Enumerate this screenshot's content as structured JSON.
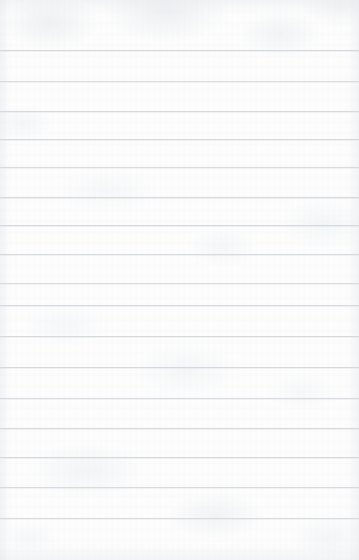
{
  "page": {
    "kind": "ruled-notebook-paper",
    "width": 359,
    "height": 560,
    "background_color": "#fdfdfd",
    "paper_tint": "#fafbfc",
    "written_text": "",
    "has_margin_rule": false,
    "has_holes": false
  },
  "rules": {
    "color": "#d5d8dc",
    "thickness": 1,
    "spacing": 31,
    "count": 16,
    "first_line_y": 50,
    "last_line_y": 518,
    "top_margin": 50,
    "bottom_margin": 42,
    "left_inset": 0,
    "right_inset": 0,
    "y_positions": [
      50,
      81,
      111,
      139,
      167,
      197,
      225,
      254,
      283,
      305,
      336,
      367,
      398,
      428,
      457,
      487,
      518
    ]
  }
}
